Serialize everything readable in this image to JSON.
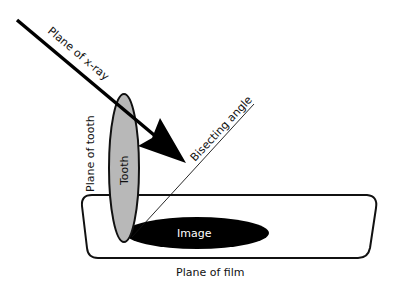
{
  "diagram": {
    "type": "bisecting-angle-technique",
    "labels": {
      "xray_plane": "Plane of x-ray",
      "tooth_plane": "Plane of tooth",
      "tooth": "Tooth",
      "bisecting": "Bisecting angle",
      "image": "Image",
      "film_plane": "Plane of film"
    },
    "colors": {
      "stroke": "#111111",
      "tooth_fill": "#b8b8b8",
      "image_fill": "#000000",
      "background": "#ffffff"
    }
  }
}
